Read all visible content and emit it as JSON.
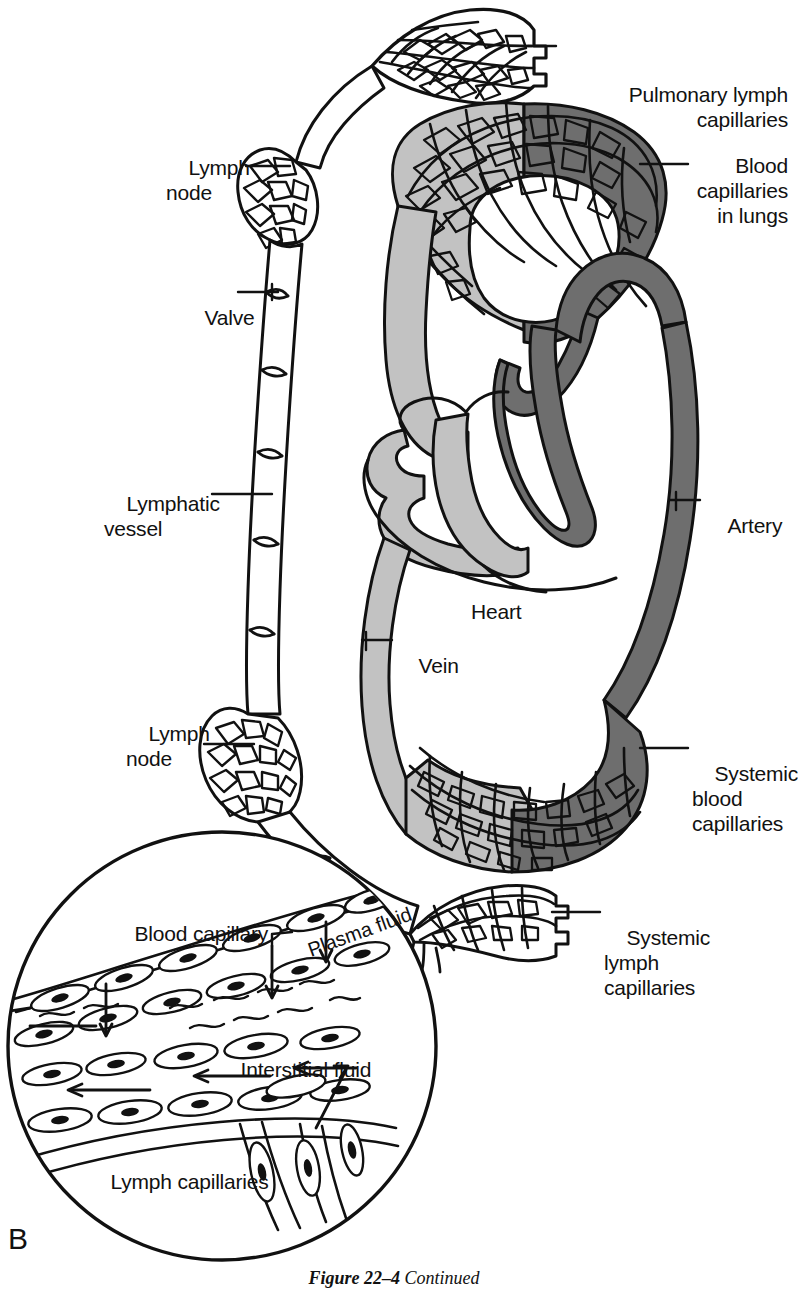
{
  "figure": {
    "panel_letter": "B",
    "caption_bold": "Figure 22–4",
    "caption_italic": " Continued"
  },
  "labels": {
    "pulmonary_lymph_capillaries": "Pulmonary lymph\ncapillaries",
    "blood_capillaries_in_lungs": "Blood\ncapillaries\nin lungs",
    "lymph_node_top": "Lymph\nnode",
    "valve": "Valve",
    "lymphatic_vessel": "Lymphatic\nvessel",
    "artery": "Artery",
    "heart": "Heart",
    "vein": "Vein",
    "lymph_node_bottom": "Lymph\nnode",
    "systemic_blood_capillaries": "Systemic\nblood\ncapillaries",
    "systemic_lymph_capillaries": "Systemic\nlymph\ncapillaries",
    "blood_capillary": "Blood capillary",
    "plasma_fluid": "Plasma fluid",
    "interstitial_fluid": "Interstitial fluid",
    "lymph_capillaries": "Lymph capillaries"
  },
  "colors": {
    "ink": "#111111",
    "oxygenated_dark_gray": "#6e6e6e",
    "deoxygenated_light_gray": "#c2c2c2",
    "lymph_white": "#ffffff",
    "background": "#ffffff"
  },
  "diagram": {
    "type": "anatomical-schematic",
    "components": [
      "pulmonary lymph capillary bed",
      "pulmonary blood capillary bed",
      "upper lymph node",
      "valve in lymphatic vessel",
      "lymphatic vessel trunk",
      "heart with four chambers",
      "aorta / systemic artery",
      "systemic vein",
      "lower lymph node",
      "systemic blood capillary bed",
      "systemic lymph capillary bed",
      "inset: capillary exchange detail"
    ],
    "inset": {
      "shape": "circle",
      "shows": [
        "blood capillary endothelium with nuclei",
        "plasma fluid leaving capillary",
        "interstitial fluid in tissue space",
        "lymph capillaries absorbing fluid"
      ]
    }
  }
}
